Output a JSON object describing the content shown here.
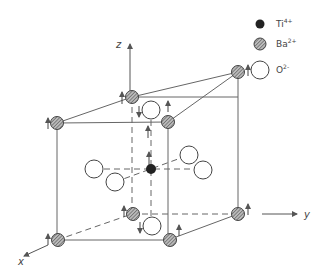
{
  "diagram": {
    "title": "",
    "type": "crystal-structure",
    "axes": [
      {
        "label": "z"
      },
      {
        "label": "y"
      },
      {
        "label": "x"
      }
    ],
    "legend": [
      {
        "symbol": "filled-circle",
        "ion": "Ti",
        "charge": "4+"
      },
      {
        "symbol": "hatched-circle",
        "ion": "Ba",
        "charge": "2+"
      },
      {
        "symbol": "open-circle",
        "ion": "O",
        "charge": "2-"
      }
    ],
    "colors": {
      "line": "#555555",
      "ti_fill": "#222222",
      "ba_fill": "#888888",
      "o_fill": "#ffffff"
    }
  }
}
